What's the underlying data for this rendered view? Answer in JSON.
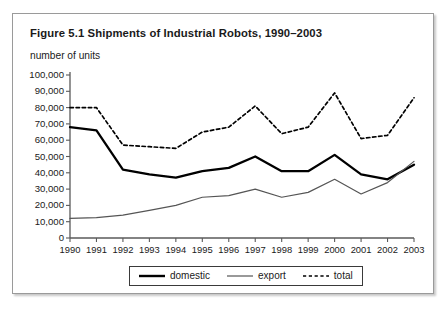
{
  "figure": {
    "title": "Figure 5.1  Shipments of Industrial Robots, 1990–2003",
    "axis_note": "number of units"
  },
  "legend": {
    "items": [
      {
        "label": "domestic",
        "style": "thick-solid",
        "color": "#000000"
      },
      {
        "label": "export",
        "style": "thin-solid",
        "color": "#555555"
      },
      {
        "label": "total",
        "style": "dashed",
        "color": "#000000"
      }
    ]
  },
  "chart_data": {
    "type": "line",
    "title": "Figure 5.1  Shipments of Industrial Robots, 1990–2003",
    "subtitle": "number of units",
    "xlabel": "",
    "ylabel": "number of units",
    "x": [
      1990,
      1991,
      1992,
      1993,
      1994,
      1995,
      1996,
      1997,
      1998,
      1999,
      2000,
      2001,
      2002,
      2003
    ],
    "categories": [
      "1990",
      "1991",
      "1992",
      "1993",
      "1994",
      "1995",
      "1996",
      "1997",
      "1998",
      "1999",
      "2000",
      "2001",
      "2002",
      "2003"
    ],
    "ylim": [
      0,
      100000
    ],
    "yticks": [
      0,
      10000,
      20000,
      30000,
      40000,
      50000,
      60000,
      70000,
      80000,
      90000,
      100000
    ],
    "ytick_labels": [
      "0",
      "10,000",
      "20,000",
      "30,000",
      "40,000",
      "50,000",
      "60,000",
      "70,000",
      "80,000",
      "90,000",
      "100,000"
    ],
    "grid": false,
    "legend_position": "bottom",
    "series": [
      {
        "name": "domestic",
        "style": "thick-solid",
        "color": "#000000",
        "values": [
          68000,
          66000,
          42000,
          39000,
          37000,
          41000,
          43000,
          50000,
          41000,
          41000,
          51000,
          39000,
          36000,
          45000
        ]
      },
      {
        "name": "export",
        "style": "thin-solid",
        "color": "#555555",
        "values": [
          12000,
          12500,
          14000,
          17000,
          20000,
          25000,
          26000,
          30000,
          25000,
          28000,
          36000,
          27000,
          34000,
          47000
        ]
      },
      {
        "name": "total",
        "style": "dashed",
        "color": "#000000",
        "values": [
          80000,
          80000,
          57000,
          56000,
          55000,
          65000,
          68000,
          81000,
          64000,
          68000,
          89000,
          61000,
          63000,
          86000
        ]
      }
    ]
  }
}
